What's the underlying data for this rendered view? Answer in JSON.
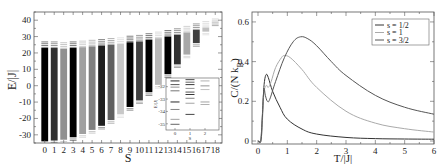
{
  "chart_data": [
    {
      "type": "bar",
      "title": "",
      "xlabel": "S",
      "ylabel": "E/|J|",
      "ylim": [
        -35,
        45
      ],
      "yticks": [
        -30,
        -20,
        -10,
        0,
        10,
        20,
        30,
        40
      ],
      "categories": [
        "0",
        "1",
        "2",
        "3",
        "4",
        "5",
        "6",
        "7",
        "8",
        "9",
        "10",
        "11",
        "12",
        "13",
        "14",
        "15",
        "16",
        "17",
        "18"
      ],
      "bars": [
        {
          "S": 0,
          "min": -34,
          "max": 27,
          "shade": "#000000"
        },
        {
          "S": 1,
          "min": -33.5,
          "max": 27,
          "shade": "#303030"
        },
        {
          "S": 2,
          "min": -33,
          "max": 26.5,
          "shade": "#909090"
        },
        {
          "S": 3,
          "min": -31.5,
          "max": 27,
          "shade": "#000000"
        },
        {
          "S": 4,
          "min": -29.5,
          "max": 27.5,
          "shade": "#a0a0a0"
        },
        {
          "S": 5,
          "min": -27,
          "max": 28,
          "shade": "#808080"
        },
        {
          "S": 6,
          "min": -24.5,
          "max": 28.5,
          "shade": "#202020"
        },
        {
          "S": 7,
          "min": -21,
          "max": 29,
          "shade": "#606060"
        },
        {
          "S": 8,
          "min": -17.5,
          "max": 29.5,
          "shade": "#c8c8c8"
        },
        {
          "S": 9,
          "min": -13,
          "max": 30.5,
          "shade": "#000000"
        },
        {
          "S": 10,
          "min": -9,
          "max": 31,
          "shade": "#404040"
        },
        {
          "S": 11,
          "min": -4,
          "max": 32,
          "shade": "#000000"
        },
        {
          "S": 12,
          "min": 0.5,
          "max": 33,
          "shade": "#b8b8b8"
        },
        {
          "S": 13,
          "min": 7,
          "max": 34,
          "shade": "#000000"
        },
        {
          "S": 14,
          "min": 13,
          "max": 35,
          "shade": "#303030"
        },
        {
          "S": 15,
          "min": 19,
          "max": 36.5,
          "shade": "#a8a8a8"
        },
        {
          "S": 16,
          "min": 26,
          "max": 38,
          "shade": "#404040"
        },
        {
          "S": 17,
          "min": 33,
          "max": 39.5,
          "shade": "#c0c0c0"
        },
        {
          "S": 18,
          "min": 40,
          "max": 41,
          "shade": "#b0b0b0"
        }
      ],
      "inset": {
        "xlabel": "S",
        "ylabel": "E/|J|",
        "xticks": [
          "0",
          "1",
          "2"
        ],
        "yticks": [
          -32,
          -33,
          -34,
          -35
        ],
        "ylim": [
          -35.5,
          -31.3
        ]
      }
    },
    {
      "type": "line",
      "title": "",
      "xlabel": "T/|J|",
      "ylabel": "C/(N k_B)",
      "ylabel_main": "C/(N k",
      "ylabel_sub": "B",
      "ylabel_end": ")",
      "xlim": [
        0,
        6
      ],
      "ylim": [
        0,
        0.65
      ],
      "xticks": [
        0,
        1,
        2,
        3,
        4,
        5,
        6
      ],
      "yticks": [
        0,
        0.2,
        0.4,
        0.6
      ],
      "ytick_labels": [
        "0",
        "0.2",
        "0.4",
        "0.6"
      ],
      "legend_position": "upper right",
      "series": [
        {
          "name": "s = 1/2",
          "color": "#333333",
          "points": [
            [
              0,
              0
            ],
            [
              0.08,
              0
            ],
            [
              0.12,
              0.05
            ],
            [
              0.18,
              0.22
            ],
            [
              0.22,
              0.3
            ],
            [
              0.28,
              0.335
            ],
            [
              0.35,
              0.32
            ],
            [
              0.5,
              0.25
            ],
            [
              0.75,
              0.17
            ],
            [
              1,
              0.11
            ],
            [
              1.5,
              0.06
            ],
            [
              2,
              0.035
            ],
            [
              3,
              0.018
            ],
            [
              4,
              0.012
            ],
            [
              5,
              0.01
            ],
            [
              6,
              0.009
            ]
          ]
        },
        {
          "name": "s = 1",
          "color": "#aaaaaa",
          "points": [
            [
              0,
              0
            ],
            [
              0.1,
              0
            ],
            [
              0.15,
              0.1
            ],
            [
              0.2,
              0.24
            ],
            [
              0.28,
              0.28
            ],
            [
              0.35,
              0.27
            ],
            [
              0.45,
              0.3
            ],
            [
              0.6,
              0.37
            ],
            [
              0.8,
              0.42
            ],
            [
              0.9,
              0.43
            ],
            [
              1.1,
              0.42
            ],
            [
              1.5,
              0.36
            ],
            [
              2,
              0.27
            ],
            [
              3,
              0.15
            ],
            [
              4,
              0.09
            ],
            [
              5,
              0.062
            ],
            [
              6,
              0.045
            ]
          ]
        },
        {
          "name": "s = 3/2",
          "color": "#555555",
          "points": [
            [
              0,
              0
            ],
            [
              0.1,
              0
            ],
            [
              0.15,
              0.12
            ],
            [
              0.2,
              0.26
            ],
            [
              0.25,
              0.23
            ],
            [
              0.32,
              0.2
            ],
            [
              0.4,
              0.21
            ],
            [
              0.6,
              0.3
            ],
            [
              0.9,
              0.42
            ],
            [
              1.2,
              0.5
            ],
            [
              1.45,
              0.525
            ],
            [
              1.7,
              0.515
            ],
            [
              2,
              0.48
            ],
            [
              2.5,
              0.4
            ],
            [
              3,
              0.33
            ],
            [
              4,
              0.23
            ],
            [
              5,
              0.17
            ],
            [
              6,
              0.135
            ]
          ]
        }
      ]
    }
  ]
}
